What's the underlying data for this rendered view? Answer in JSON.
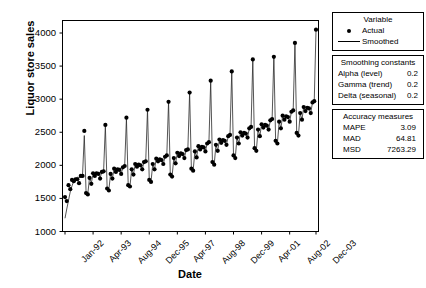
{
  "chart_data": {
    "type": "line",
    "title": "",
    "xlabel": "Date",
    "ylabel": "Liquor store sales",
    "ylim": [
      1000,
      4200
    ],
    "yticks": [
      1000,
      1500,
      2000,
      2500,
      3000,
      3500,
      4000
    ],
    "xtick_labels": [
      "Jan-92",
      "Apr-93",
      "Aug-94",
      "Dec-95",
      "Apr-97",
      "Aug-98",
      "Dec-99",
      "Apr-01",
      "Aug-02",
      "Dec-03"
    ],
    "grid": false,
    "legend_position": "right",
    "series": [
      {
        "name": "Actual",
        "style": "points",
        "values": [
          1520,
          1460,
          1700,
          1640,
          1780,
          1760,
          1790,
          1790,
          1730,
          1840,
          1840,
          2520,
          1580,
          1560,
          1810,
          1720,
          1880,
          1840,
          1880,
          1870,
          1800,
          1900,
          1910,
          2610,
          1650,
          1620,
          1870,
          1800,
          1950,
          1900,
          1940,
          1930,
          1870,
          1970,
          1990,
          2720,
          1700,
          1680,
          1940,
          1860,
          2020,
          1980,
          2010,
          2000,
          1940,
          2050,
          2060,
          2840,
          1780,
          1750,
          2020,
          1940,
          2100,
          2060,
          2090,
          2080,
          2020,
          2130,
          2150,
          2960,
          1860,
          1830,
          2110,
          2030,
          2190,
          2140,
          2180,
          2170,
          2110,
          2230,
          2240,
          3100,
          1950,
          1920,
          2210,
          2120,
          2290,
          2240,
          2280,
          2270,
          2210,
          2330,
          2350,
          3280,
          2050,
          2010,
          2310,
          2220,
          2390,
          2340,
          2380,
          2370,
          2310,
          2440,
          2460,
          3420,
          2150,
          2110,
          2420,
          2330,
          2500,
          2450,
          2490,
          2480,
          2420,
          2560,
          2580,
          3600,
          2260,
          2220,
          2540,
          2440,
          2620,
          2570,
          2610,
          2600,
          2540,
          2680,
          2700,
          3640,
          2370,
          2330,
          2660,
          2560,
          2750,
          2690,
          2740,
          2730,
          2660,
          2810,
          2830,
          3850,
          2490,
          2450,
          2790,
          2690,
          2880,
          2820,
          2870,
          2860,
          2790,
          2950,
          2970,
          4050
        ]
      },
      {
        "name": "Smoothed",
        "style": "line",
        "values": [
          1200,
          1340,
          1470,
          1600,
          1690,
          1760,
          1800,
          1820,
          1810,
          1830,
          1860,
          2450,
          1600,
          1570,
          1820,
          1730,
          1880,
          1850,
          1880,
          1870,
          1810,
          1900,
          1920,
          2600,
          1660,
          1630,
          1880,
          1800,
          1950,
          1910,
          1940,
          1930,
          1870,
          1970,
          1990,
          2710,
          1710,
          1680,
          1940,
          1860,
          2020,
          1980,
          2010,
          2000,
          1940,
          2050,
          2070,
          2840,
          1780,
          1750,
          2020,
          1940,
          2100,
          2060,
          2090,
          2080,
          2020,
          2130,
          2150,
          2960,
          1860,
          1830,
          2110,
          2030,
          2190,
          2150,
          2180,
          2170,
          2110,
          2230,
          2250,
          3100,
          1950,
          1920,
          2210,
          2130,
          2290,
          2240,
          2280,
          2270,
          2210,
          2330,
          2350,
          3270,
          2050,
          2010,
          2310,
          2220,
          2390,
          2340,
          2380,
          2370,
          2310,
          2440,
          2460,
          3420,
          2150,
          2110,
          2420,
          2330,
          2500,
          2450,
          2490,
          2480,
          2420,
          2560,
          2580,
          3590,
          2260,
          2220,
          2540,
          2440,
          2620,
          2570,
          2610,
          2600,
          2540,
          2680,
          2700,
          3650,
          2370,
          2330,
          2660,
          2560,
          2750,
          2700,
          2740,
          2730,
          2660,
          2810,
          2830,
          3840,
          2490,
          2450,
          2790,
          2690,
          2880,
          2820,
          2870,
          2860,
          2790,
          2950,
          2970,
          4040
        ]
      }
    ]
  },
  "axes": {
    "ylabel": "Liquor store sales",
    "xlabel": "Date",
    "yticks": [
      "4000",
      "3500",
      "3000",
      "2500",
      "2000",
      "1500",
      "1000"
    ],
    "xticks": [
      "Jan-92",
      "Apr-93",
      "Aug-94",
      "Dec-95",
      "Apr-97",
      "Aug-98",
      "Dec-99",
      "Apr-01",
      "Aug-02",
      "Dec-03"
    ]
  },
  "variable_panel": {
    "title": "Variable",
    "rows": [
      {
        "key_icon": "filled-circle-marker",
        "label": "Actual"
      },
      {
        "key_icon": "solid-line-marker",
        "label": "Smoothed"
      }
    ]
  },
  "smoothing_panel": {
    "title": "Smoothing constants",
    "rows": [
      {
        "name": "Alpha (level)",
        "value": "0.2"
      },
      {
        "name": "Gamma (trend)",
        "value": "0.2"
      },
      {
        "name": "Delta (seasonal)",
        "value": "0.2"
      }
    ]
  },
  "accuracy_panel": {
    "title": "Accuracy measures",
    "rows": [
      {
        "name": "MAPE",
        "value": "3.09"
      },
      {
        "name": "MAD",
        "value": "64.81"
      },
      {
        "name": "MSD",
        "value": "7263.29"
      }
    ]
  },
  "colors": {
    "ink": "#000000",
    "background": "#ffffff"
  }
}
